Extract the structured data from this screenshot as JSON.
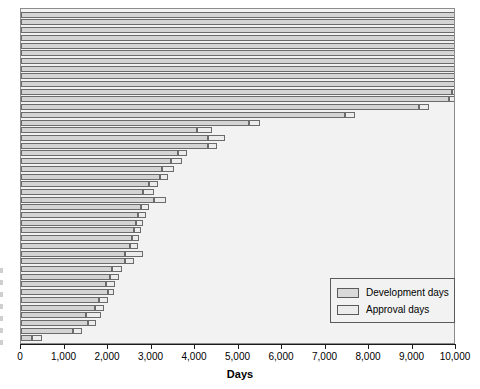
{
  "chart_data": {
    "type": "bar",
    "orientation": "horizontal",
    "stacked": true,
    "title": "",
    "xlabel": "Days",
    "ylabel": "",
    "xlim": [
      0,
      10000
    ],
    "ylim": null,
    "grid": false,
    "legend_position": "bottom-right",
    "xticks": [
      0,
      1000,
      2000,
      3000,
      4000,
      5000,
      6000,
      7000,
      8000,
      9000,
      10000
    ],
    "xtick_labels": [
      "0",
      "1,000",
      "2,000",
      "3,000",
      "4,000",
      "5,000",
      "6,000",
      "7,000",
      "8,000",
      "9,000",
      "10,000"
    ],
    "categories": [
      "item-1",
      "item-2",
      "item-3",
      "item-4",
      "item-5",
      "item-6",
      "item-7",
      "item-8",
      "item-9",
      "item-10",
      "item-11",
      "item-12",
      "item-13",
      "item-14",
      "item-15",
      "item-16",
      "item-17",
      "item-18",
      "item-19",
      "item-20",
      "item-21",
      "item-22",
      "item-23",
      "item-24",
      "item-25",
      "item-26",
      "item-27",
      "item-28",
      "item-29",
      "item-30",
      "item-31",
      "item-32",
      "item-33",
      "item-34",
      "item-35",
      "item-36",
      "item-37",
      "item-38",
      "item-39",
      "item-40",
      "item-41",
      "item-42",
      "item-43"
    ],
    "series": [
      {
        "name": "Development days",
        "values": [
          10000,
          10000,
          10000,
          10000,
          10000,
          10000,
          10000,
          10000,
          10000,
          10000,
          9900,
          9850,
          9150,
          7450,
          5250,
          4050,
          4300,
          4300,
          3600,
          3450,
          3250,
          3200,
          2950,
          2800,
          3050,
          2750,
          2700,
          2650,
          2600,
          2550,
          2500,
          2400,
          2400,
          2100,
          2050,
          1950,
          2000,
          1800,
          1700,
          1500,
          1550,
          1200,
          250
        ]
      },
      {
        "name": "Approval days",
        "values": [
          0,
          0,
          0,
          0,
          0,
          0,
          0,
          0,
          0,
          120,
          170,
          180,
          240,
          230,
          250,
          350,
          400,
          200,
          220,
          250,
          270,
          170,
          200,
          250,
          280,
          200,
          180,
          160,
          150,
          160,
          180,
          400,
          200,
          230,
          200,
          200,
          130,
          200,
          200,
          350,
          180,
          200,
          230
        ]
      }
    ]
  },
  "legend": {
    "items": [
      {
        "label": "Development days",
        "color": "#d9d9d9"
      },
      {
        "label": "Approval days",
        "color": "#ececec"
      }
    ]
  },
  "axis": {
    "x_title": "Days"
  },
  "colors": {
    "plot_background": "#f2f2f2",
    "development_fill": "#d4d4d4",
    "approval_fill": "#ececec",
    "bar_stroke": "#6b6b6b",
    "frame": "#8c8c8c",
    "axis": "#1a1a1a"
  }
}
